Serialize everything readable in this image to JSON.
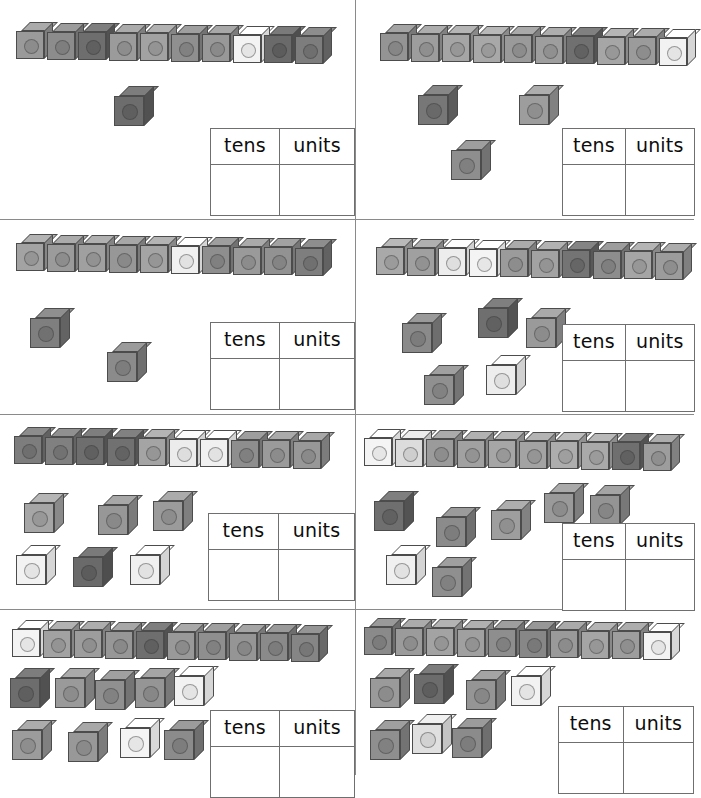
{
  "worksheet": {
    "title": "Tens and Units – Linking Cubes",
    "topic": "place value",
    "table_headers": {
      "tens": "tens",
      "units": "units"
    },
    "answer_value": "",
    "colors": {
      "paper": "#ffffff",
      "grid_line": "#8a8a8a",
      "cube_outline": "#4c4c4c",
      "table_border": "#6f6f6f",
      "text": "#0d0d0d"
    },
    "grid": {
      "columns": 2,
      "rows": 4,
      "exercise_count": 8
    }
  },
  "exercises": [
    {
      "id": "exercise-1",
      "position": "row-1-left",
      "rod": {
        "label": "rod-of-ten",
        "cube_count": 10,
        "shades": [
          "#9a9a9a",
          "#8c8c8c",
          "#6e6e6e",
          "#9b9b9b",
          "#a2a2a2",
          "#8f8f8f",
          "#989898",
          "#f3f3f3",
          "#6a6a6a",
          "#7d7d7d"
        ]
      },
      "loose_cubes": {
        "count": 1,
        "shades": [
          "#6d6d6d"
        ],
        "layout": [
          {
            "x": 114,
            "y": 86,
            "shade": "#6d6d6d"
          }
        ]
      },
      "table": {
        "tens": "",
        "units": ""
      }
    },
    {
      "id": "exercise-2",
      "position": "row-1-right",
      "rod": {
        "label": "rod-of-ten",
        "cube_count": 10,
        "shades": [
          "#949494",
          "#9d9d9d",
          "#a5a5a5",
          "#a8a8a8",
          "#9a9a9a",
          "#9e9e9e",
          "#707070",
          "#a6a6a6",
          "#9b9b9b",
          "#f2f2f2"
        ]
      },
      "loose_cubes": {
        "count": 3,
        "shades": [
          "#777777",
          "#9d9d9d",
          "#8e8e8e"
        ],
        "layout": [
          {
            "x": 62,
            "y": 85,
            "shade": "#777777"
          },
          {
            "x": 163,
            "y": 85,
            "shade": "#9d9d9d"
          },
          {
            "x": 95,
            "y": 140,
            "shade": "#8e8e8e"
          }
        ]
      },
      "table": {
        "tens": "",
        "units": ""
      }
    },
    {
      "id": "exercise-3",
      "position": "row-2-left",
      "rod": {
        "label": "rod-of-ten",
        "cube_count": 10,
        "shades": [
          "#a3a3a3",
          "#9b9b9b",
          "#a0a0a0",
          "#979797",
          "#a4a4a4",
          "#f0f0f0",
          "#8e8e8e",
          "#9a9a9a",
          "#929292",
          "#7e7e7e"
        ]
      },
      "loose_cubes": {
        "count": 2,
        "shades": [
          "#7f7f7f",
          "#8b8b8b"
        ],
        "layout": [
          {
            "x": 30,
            "y": 88,
            "shade": "#7f7f7f"
          },
          {
            "x": 107,
            "y": 122,
            "shade": "#8b8b8b"
          }
        ]
      },
      "table": {
        "tens": "",
        "units": ""
      }
    },
    {
      "id": "exercise-4",
      "position": "row-2-right",
      "rod": {
        "label": "rod-of-ten",
        "cube_count": 10,
        "shades": [
          "#a9a9a9",
          "#a0a0a0",
          "#ededed",
          "#f4f4f4",
          "#9b9b9b",
          "#a2a2a2",
          "#747474",
          "#8d8d8d",
          "#a5a5a5",
          "#9c9c9c"
        ]
      },
      "loose_cubes": {
        "count": 5,
        "shades": [
          "#8a8a8a",
          "#6f6f6f",
          "#9a9a9a",
          "#909090",
          "#ededed"
        ],
        "layout": [
          {
            "x": 46,
            "y": 93,
            "shade": "#8a8a8a"
          },
          {
            "x": 122,
            "y": 78,
            "shade": "#6f6f6f"
          },
          {
            "x": 170,
            "y": 88,
            "shade": "#9a9a9a"
          },
          {
            "x": 68,
            "y": 145,
            "shade": "#909090"
          },
          {
            "x": 130,
            "y": 135,
            "shade": "#ededed"
          }
        ]
      },
      "table": {
        "tens": "",
        "units": ""
      }
    },
    {
      "id": "exercise-5",
      "position": "row-3-left",
      "rod": {
        "label": "rod-of-ten",
        "cube_count": 10,
        "shades": [
          "#7d7d7d",
          "#808080",
          "#6e6e6e",
          "#717171",
          "#a4a4a4",
          "#ececec",
          "#f0f0f0",
          "#8e8e8e",
          "#9a9a9a",
          "#989898"
        ]
      },
      "loose_cubes": {
        "count": 6,
        "shades": [
          "#a6a6a6",
          "#979797",
          "#9b9b9b",
          "#f2f2f2",
          "#6a6a6a",
          "#f0f0f0"
        ],
        "layout": [
          {
            "x": 24,
            "y": 78,
            "shade": "#a6a6a6"
          },
          {
            "x": 98,
            "y": 80,
            "shade": "#979797"
          },
          {
            "x": 153,
            "y": 76,
            "shade": "#9b9b9b"
          },
          {
            "x": 16,
            "y": 130,
            "shade": "#f2f2f2"
          },
          {
            "x": 73,
            "y": 132,
            "shade": "#6a6a6a"
          },
          {
            "x": 130,
            "y": 130,
            "shade": "#f0f0f0"
          }
        ]
      },
      "table": {
        "tens": "",
        "units": ""
      }
    },
    {
      "id": "exercise-6",
      "position": "row-3-right",
      "rod": {
        "label": "rod-of-ten",
        "cube_count": 10,
        "shades": [
          "#f4f4f4",
          "#dcdcdc",
          "#9b9b9b",
          "#a1a1a1",
          "#a6a6a6",
          "#a3a3a3",
          "#adadad",
          "#a9a9a9",
          "#6f6f6f",
          "#9d9d9d"
        ]
      },
      "loose_cubes": {
        "count": 7,
        "shades": [
          "#6f6f6f",
          "#8b8b8b",
          "#9e9e9e",
          "#9a9a9a",
          "#949494",
          "#f0f0f0",
          "#8f8f8f"
        ],
        "layout": [
          {
            "x": 18,
            "y": 76,
            "shade": "#6f6f6f"
          },
          {
            "x": 80,
            "y": 92,
            "shade": "#8b8b8b"
          },
          {
            "x": 135,
            "y": 85,
            "shade": "#9e9e9e"
          },
          {
            "x": 188,
            "y": 68,
            "shade": "#9a9a9a"
          },
          {
            "x": 234,
            "y": 70,
            "shade": "#949494"
          },
          {
            "x": 30,
            "y": 130,
            "shade": "#f0f0f0"
          },
          {
            "x": 76,
            "y": 142,
            "shade": "#8f8f8f"
          }
        ]
      },
      "table": {
        "tens": "",
        "units": ""
      }
    },
    {
      "id": "exercise-7",
      "position": "row-4-left",
      "rod": {
        "label": "rod-of-ten",
        "cube_count": 10,
        "shades": [
          "#f3f3f3",
          "#a2a2a2",
          "#9d9d9d",
          "#979797",
          "#6e6e6e",
          "#999999",
          "#8f8f8f",
          "#959595",
          "#8a8a8a",
          "#858585"
        ]
      },
      "loose_cubes": {
        "count": 9,
        "shades": [
          "#6d6d6d",
          "#9a9a9a",
          "#909090",
          "#959595",
          "#f2f2f2",
          "#9c9c9c",
          "#989898",
          "#f4f4f4",
          "#8b8b8b"
        ],
        "layout": [
          {
            "x": 10,
            "y": 58,
            "shade": "#6d6d6d"
          },
          {
            "x": 55,
            "y": 58,
            "shade": "#9a9a9a"
          },
          {
            "x": 95,
            "y": 60,
            "shade": "#909090"
          },
          {
            "x": 135,
            "y": 58,
            "shade": "#959595"
          },
          {
            "x": 174,
            "y": 56,
            "shade": "#f2f2f2"
          },
          {
            "x": 12,
            "y": 110,
            "shade": "#9c9c9c"
          },
          {
            "x": 68,
            "y": 112,
            "shade": "#989898"
          },
          {
            "x": 120,
            "y": 108,
            "shade": "#f4f4f4"
          },
          {
            "x": 164,
            "y": 110,
            "shade": "#8b8b8b"
          }
        ]
      },
      "table": {
        "tens": "",
        "units": ""
      }
    },
    {
      "id": "exercise-8",
      "position": "row-4-right",
      "rod": {
        "label": "rod-of-ten",
        "cube_count": 10,
        "shades": [
          "#8a8a8a",
          "#9b9b9b",
          "#a3a3a3",
          "#a0a0a0",
          "#8e8e8e",
          "#878787",
          "#9a9a9a",
          "#a5a5a5",
          "#9d9d9d",
          "#f3f3f3"
        ]
      },
      "loose_cubes": {
        "count": 7,
        "shades": [
          "#9a9a9a",
          "#6c6c6c",
          "#959595",
          "#f2f2f2",
          "#8f8f8f",
          "#e0e0e0",
          "#8b8b8b"
        ],
        "layout": [
          {
            "x": 14,
            "y": 58,
            "shade": "#9a9a9a"
          },
          {
            "x": 58,
            "y": 54,
            "shade": "#6c6c6c"
          },
          {
            "x": 110,
            "y": 60,
            "shade": "#959595"
          },
          {
            "x": 155,
            "y": 56,
            "shade": "#f2f2f2"
          },
          {
            "x": 14,
            "y": 110,
            "shade": "#8f8f8f"
          },
          {
            "x": 56,
            "y": 104,
            "shade": "#e0e0e0"
          },
          {
            "x": 96,
            "y": 108,
            "shade": "#8b8b8b"
          }
        ]
      },
      "table": {
        "tens": "",
        "units": ""
      }
    }
  ]
}
